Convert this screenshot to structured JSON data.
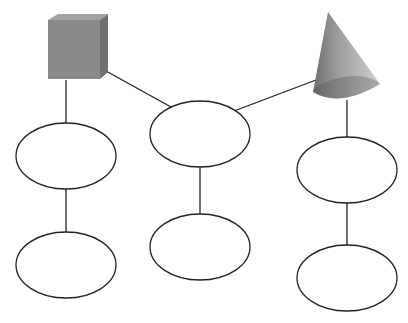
{
  "diagram": {
    "type": "tree-graphic-organizer",
    "shapes": [
      {
        "id": "cube",
        "kind": "cube",
        "color": "#8a8a8a"
      },
      {
        "id": "cone",
        "kind": "cone",
        "color": "#8c8c8c"
      }
    ],
    "nodes": [
      {
        "id": "left-top",
        "label": ""
      },
      {
        "id": "left-bottom",
        "label": ""
      },
      {
        "id": "center-top",
        "label": ""
      },
      {
        "id": "center-bottom",
        "label": ""
      },
      {
        "id": "right-top",
        "label": ""
      },
      {
        "id": "right-bottom",
        "label": ""
      }
    ],
    "edges": [
      {
        "from": "cube",
        "to": "left-top"
      },
      {
        "from": "left-top",
        "to": "left-bottom"
      },
      {
        "from": "cube",
        "to": "center-top"
      },
      {
        "from": "cone",
        "to": "center-top"
      },
      {
        "from": "center-top",
        "to": "center-bottom"
      },
      {
        "from": "cone",
        "to": "right-top"
      },
      {
        "from": "right-top",
        "to": "right-bottom"
      }
    ],
    "colors": {
      "line": "#222222",
      "ellipse_fill": "#ffffff"
    }
  }
}
